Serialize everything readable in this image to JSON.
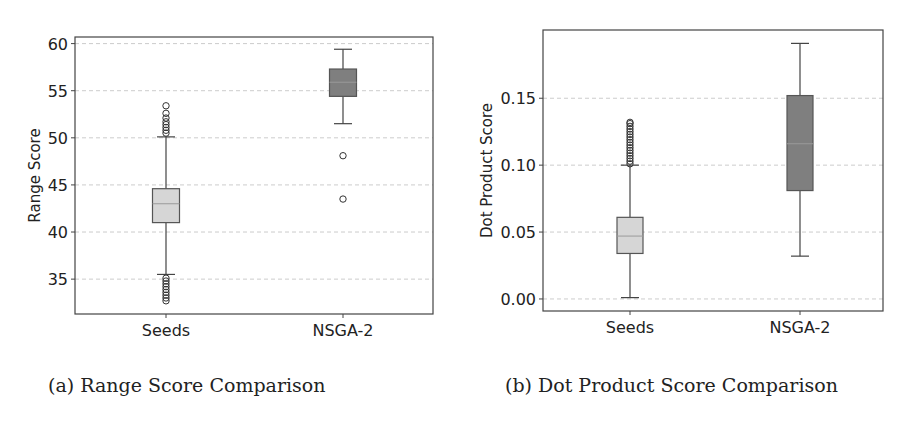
{
  "figure": {
    "captions": {
      "a": "(a) Range Score Comparison",
      "b": "(b) Dot Product Score Comparison"
    }
  },
  "colors": {
    "seeds_box": "#d6d6d6",
    "nsga_box": "#7f7f7f",
    "grid": "#cccccc",
    "frame": "#444444",
    "whisker": "#444444"
  },
  "chart_data": [
    {
      "type": "box",
      "title": "Range Score Comparison",
      "xlabel": "",
      "ylabel": "Range Score",
      "categories": [
        "Seeds",
        "NSGA-2"
      ],
      "ylim": [
        31.3,
        60.7
      ],
      "yticks": [
        35,
        40,
        45,
        50,
        55,
        60
      ],
      "ytick_labels": [
        "35",
        "40",
        "45",
        "50",
        "55",
        "60"
      ],
      "grid": "horizontal dashed",
      "legend": "none",
      "series": [
        {
          "name": "Seeds",
          "whisker_low": 35.5,
          "q1": 41.0,
          "median": 43.0,
          "q3": 44.6,
          "whisker_high": 50.1,
          "outliers": [
            32.7,
            33.0,
            33.3,
            33.6,
            33.9,
            34.2,
            34.5,
            34.8,
            35.1,
            50.5,
            50.8,
            51.1,
            51.4,
            51.7,
            52.1,
            52.6,
            53.4
          ],
          "color": "#d6d6d6"
        },
        {
          "name": "NSGA-2",
          "whisker_low": 51.5,
          "q1": 54.4,
          "median": 55.9,
          "q3": 57.3,
          "whisker_high": 59.4,
          "outliers": [
            48.1,
            43.5
          ],
          "color": "#7f7f7f"
        }
      ]
    },
    {
      "type": "box",
      "title": "Dot Product Score Comparison",
      "xlabel": "",
      "ylabel": "Dot Product Score",
      "categories": [
        "Seeds",
        "NSGA-2"
      ],
      "ylim": [
        -0.009,
        0.201
      ],
      "yticks": [
        0.0,
        0.05,
        0.1,
        0.15
      ],
      "ytick_labels": [
        "0.00",
        "0.05",
        "0.10",
        "0.15"
      ],
      "grid": "horizontal dashed",
      "legend": "none",
      "series": [
        {
          "name": "Seeds",
          "whisker_low": 0.001,
          "q1": 0.034,
          "median": 0.047,
          "q3": 0.061,
          "whisker_high": 0.1,
          "outliers": [
            0.101,
            0.103,
            0.105,
            0.107,
            0.109,
            0.111,
            0.113,
            0.115,
            0.117,
            0.119,
            0.121,
            0.123,
            0.125,
            0.127,
            0.129,
            0.131,
            0.132
          ],
          "color": "#d6d6d6"
        },
        {
          "name": "NSGA-2",
          "whisker_low": 0.032,
          "q1": 0.081,
          "median": 0.116,
          "q3": 0.152,
          "whisker_high": 0.191,
          "outliers": [],
          "color": "#7f7f7f"
        }
      ]
    }
  ]
}
